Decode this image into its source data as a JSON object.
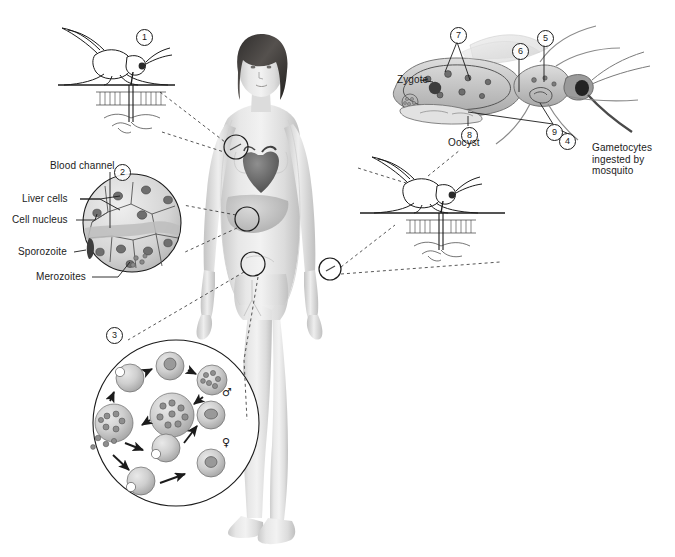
{
  "figure": {
    "background_color": "#ffffff",
    "text_color": "#1b1b1b",
    "width": 675,
    "height": 557
  },
  "stage_markers": [
    {
      "id": "1",
      "label": "1",
      "x": 143,
      "y": 36
    },
    {
      "id": "2",
      "label": "2",
      "x": 121,
      "y": 171
    },
    {
      "id": "3",
      "label": "3",
      "x": 113,
      "y": 334
    },
    {
      "id": "4",
      "label": "4",
      "x": 566,
      "y": 140
    },
    {
      "id": "5",
      "label": "5",
      "x": 537,
      "y": 31
    },
    {
      "id": "6",
      "label": "6",
      "x": 512,
      "y": 44
    },
    {
      "id": "7",
      "label": "7",
      "x": 450,
      "y": 28
    },
    {
      "id": "8",
      "label": "8",
      "x": 461,
      "y": 118
    },
    {
      "id": "9",
      "label": "9",
      "x": 546,
      "y": 128
    }
  ],
  "labels": {
    "blood_channel": {
      "text": "Blood channel",
      "x": 50,
      "y": 166
    },
    "liver_cells": {
      "text": "Liver cells",
      "x": 25,
      "y": 193
    },
    "cell_nucleus": {
      "text": "Cell nucleus",
      "x": 18,
      "y": 214
    },
    "sporozoite": {
      "text": "Sporozoite",
      "x": 24,
      "y": 246
    },
    "merozoites": {
      "text": "Merozoites",
      "x": 38,
      "y": 271
    },
    "zygote": {
      "text": "Zygote",
      "x": 397,
      "y": 78
    },
    "oocyst": {
      "text": "Oocyst",
      "x": 448,
      "y": 130
    },
    "gametocytes_ingested": {
      "text": "Gametocytes\ningested by\nmosquito",
      "x": 592,
      "y": 142
    }
  },
  "gender_symbols": [
    {
      "name": "male-gametocyte-symbol",
      "glyph": "♂",
      "x": 222,
      "y": 387
    },
    {
      "name": "female-gametocyte-symbol",
      "glyph": "♀",
      "x": 222,
      "y": 437
    }
  ],
  "scene": {
    "human_figure": "adult female human body, anterior view, with heart and liver visible",
    "top_left_mosquito": "mosquito feeding through skin, injecting sporozoites",
    "mid_right_mosquito": "mosquito feeding through skin, ingesting gametocytes",
    "top_right_mosquito": "mosquito anatomy showing midgut, oocysts and salivary glands",
    "liver_inset": "circular inset of liver cells containing sporozoite and merozoites",
    "blood_inset": "circular inset of erythrocytic cycle with ring stage, schizont, merozoites and gametocytes"
  }
}
